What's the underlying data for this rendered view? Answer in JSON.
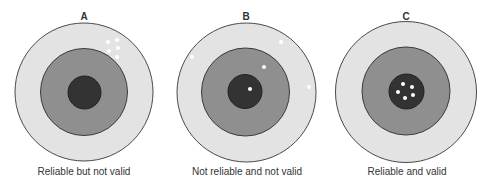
{
  "colors": {
    "background": "#ffffff",
    "outer_ring": "#e3e3e3",
    "middle_ring": "#8f8f8f",
    "bullseye": "#333333",
    "stroke": "#4a4a4a",
    "hit": "#ffffff",
    "text": "#333333"
  },
  "targets": [
    {
      "letter": "A",
      "caption": "Reliable but not valid",
      "center": [
        84,
        92
      ],
      "radii": [
        69,
        43.5,
        16.5
      ],
      "hits": [
        [
          108,
          42
        ],
        [
          117,
          40
        ],
        [
          109,
          51
        ],
        [
          118,
          48
        ],
        [
          117,
          57
        ]
      ]
    },
    {
      "letter": "B",
      "caption": "Not reliable and not valid",
      "center": [
        246,
        92
      ],
      "radii": [
        69.5,
        44,
        17
      ],
      "hits": [
        [
          192,
          57
        ],
        [
          281,
          42
        ],
        [
          264,
          67
        ],
        [
          250,
          89
        ],
        [
          309,
          87
        ]
      ]
    },
    {
      "letter": "C",
      "caption": "Reliable and valid",
      "center": [
        406,
        92
      ],
      "radii": [
        70.5,
        44,
        17.5
      ],
      "hits": [
        [
          403,
          84
        ],
        [
          412,
          87
        ],
        [
          398,
          92
        ],
        [
          413,
          95
        ],
        [
          405,
          98
        ]
      ]
    }
  ]
}
